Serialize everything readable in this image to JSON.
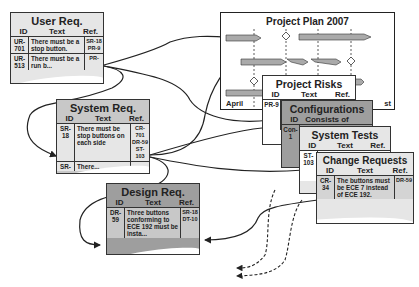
{
  "diagram": {
    "type": "requirements-traceability",
    "colors": {
      "light_card": "#e6e6e6",
      "mid_card": "#c8c8c8",
      "dark_card": "#9e9e9e",
      "white_card": "#ffffff",
      "border": "#333333",
      "link": "#222222"
    },
    "columns": {
      "id": "ID",
      "text": "Text",
      "ref": "Ref."
    },
    "user_req": {
      "title": "User Req.",
      "rows": [
        {
          "id": "UR-701",
          "text": "There must be a stop button.",
          "ref": "SR-18 PR-9"
        },
        {
          "id": "UR-513",
          "text": "There must be a run b...",
          "ref": "PR-"
        }
      ]
    },
    "system_req": {
      "title": "System Req.",
      "rows": [
        {
          "id": "SR-18",
          "text": "There must be stop buttons on each side",
          "ref": "CR-701 DR-59 ST-103"
        },
        {
          "id": "SR-",
          "text": "There...",
          "ref": ""
        }
      ]
    },
    "design_req": {
      "title": "Design Req.",
      "rows": [
        {
          "id": "DR-59",
          "text": "Three buttons conforming to ECE 192 must be insta...",
          "ref": "SR-18 DT-10"
        }
      ]
    },
    "project_plan": {
      "title": "Project Plan 2007",
      "axis_labels": [
        "April",
        "I",
        "st"
      ]
    },
    "project_risks": {
      "title": "Project Risks",
      "rows": [
        {
          "id": "PR-9",
          "text": "",
          "ref": ""
        }
      ]
    },
    "configurations": {
      "title": "Configurations",
      "header_text": "Consists of",
      "rows": [
        {
          "id": "Con-1",
          "text": "",
          "ref": ""
        }
      ]
    },
    "system_tests": {
      "title": "System Tests",
      "rows": [
        {
          "id": "ST-103",
          "text": "",
          "ref": ""
        }
      ]
    },
    "change_requests": {
      "title": "Change Requests",
      "rows": [
        {
          "id": "CR-34",
          "text": "The buttons must be ECE 7 instead of ECE 192.",
          "ref": "DR-59"
        }
      ]
    }
  }
}
